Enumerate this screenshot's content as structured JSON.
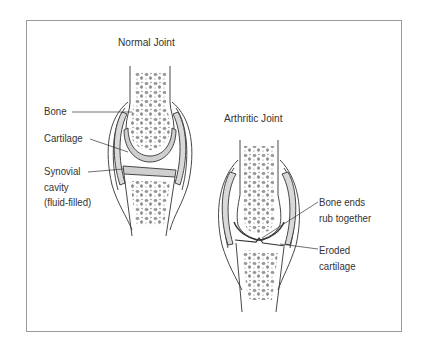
{
  "diagram": {
    "normal_joint": {
      "title": "Normal Joint",
      "labels": {
        "bone": "Bone",
        "cartilage": "Cartilage",
        "synovial_line1": "Synovial",
        "synovial_line2": "cavity",
        "synovial_line3": "(fluid-filled)"
      }
    },
    "arthritic_joint": {
      "title": "Arthritic Joint",
      "labels": {
        "bone_ends_line1": "Bone ends",
        "bone_ends_line2": "rub together",
        "eroded_line1": "Eroded",
        "eroded_line2": "cartilage"
      }
    },
    "colors": {
      "line": "#333333",
      "frame": "#9a9a9a",
      "cartilage_fill": "#d6d6d6",
      "bone_spots": "#8a8a8a"
    }
  }
}
